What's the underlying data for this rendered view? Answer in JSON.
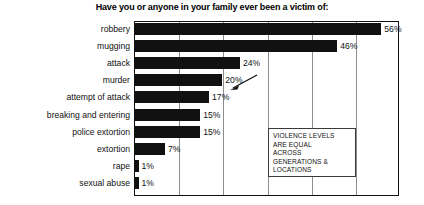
{
  "chart_data": {
    "type": "bar",
    "orientation": "horizontal",
    "title": "Have you or anyone in your family ever been a victim of:",
    "xlabel": "",
    "ylabel": "",
    "xlim": [
      0,
      60
    ],
    "grid": true,
    "gridline_values": [
      0,
      10,
      20,
      30,
      40,
      50,
      60
    ],
    "legend": "none",
    "value_suffix": "%",
    "categories": [
      "robbery",
      "mugging",
      "attack",
      "murder",
      "attempt of attack",
      "breaking and entering",
      "police extortion",
      "extortion",
      "rape",
      "sexual abuse"
    ],
    "values": [
      56,
      46,
      24,
      20,
      17,
      15,
      15,
      7,
      1,
      1
    ],
    "value_labels": [
      "56%",
      "46%",
      "24%",
      "20%",
      "17%",
      "15%",
      "15%",
      "7%",
      "1%",
      "1%"
    ],
    "bar_color": "#111111",
    "annotations": [
      {
        "name": "violence-levels-callout",
        "text": "VIOLENCE LEVELS\nARE EQUAL\nACROSS\nGENERATIONS &\nLOCATIONS"
      },
      {
        "name": "arrow-to-murder-bar",
        "points_to": "murder",
        "text": ""
      }
    ]
  }
}
